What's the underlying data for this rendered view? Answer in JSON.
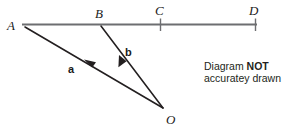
{
  "diagram": {
    "colors": {
      "baseline": "#6d6e71",
      "vector_stroke": "#231f20",
      "tick": "#6d6e71",
      "label_text": "#1a1a1a",
      "note_text": "#231f20",
      "background": "#ffffff"
    },
    "points": [
      {
        "id": "A",
        "label": "A",
        "x": 22,
        "y": 25,
        "label_x": 7,
        "label_y": 30
      },
      {
        "id": "B",
        "label": "B",
        "x": 101,
        "y": 24,
        "label_x": 95,
        "label_y": 18
      },
      {
        "id": "C",
        "label": "C",
        "x": 160,
        "y": 24,
        "label_x": 155,
        "label_y": 15
      },
      {
        "id": "D",
        "label": "D",
        "x": 255,
        "y": 24,
        "label_x": 249,
        "label_y": 15
      },
      {
        "id": "O",
        "label": "O",
        "x": 163,
        "y": 108,
        "label_x": 166,
        "label_y": 124
      }
    ],
    "baseline": {
      "from": "A",
      "to": "D",
      "x1": 22,
      "y1": 24.5,
      "x2": 257,
      "y2": 24.5
    },
    "ticks": [
      {
        "at": "C",
        "x": 160,
        "y1": 19,
        "y2": 31
      },
      {
        "at": "D",
        "x": 255,
        "y1": 19,
        "y2": 31
      }
    ],
    "vectors": [
      {
        "id": "a",
        "label": "a",
        "from": "O",
        "to": "A",
        "x1": 163,
        "y1": 108,
        "x2": 23,
        "y2": 26,
        "arrow_at": "A",
        "label_x": 68,
        "label_y": 73
      },
      {
        "id": "b",
        "label": "b",
        "from": "O",
        "to": "B",
        "x1": 163,
        "y1": 108,
        "x2": 101,
        "y2": 26,
        "arrow_at": "B",
        "label_x": 125,
        "label_y": 56
      }
    ],
    "note": {
      "line1_prefix": "Diagram ",
      "line1_emphasis": "NOT",
      "line2": "accuratey drawn"
    }
  }
}
